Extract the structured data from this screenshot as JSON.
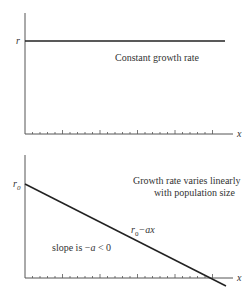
{
  "chart_data": [
    {
      "type": "line",
      "title": "Constant growth rate",
      "xlabel": "x",
      "ylabel": "r",
      "series": [
        {
          "name": "r",
          "x": [
            0,
            1
          ],
          "values": [
            1,
            1
          ]
        }
      ],
      "annotation": "Constant growth rate",
      "grid": false,
      "x_ticks": "unlabeled minor ticks with major ticks every 5"
    },
    {
      "type": "line",
      "title": "Growth rate varies linearly with population size",
      "xlabel": "x",
      "ylabel": "r0",
      "series": [
        {
          "name": "r0 - ax",
          "x": [
            0,
            1
          ],
          "values": [
            1,
            0
          ]
        }
      ],
      "annotations": [
        "Growth rate varies linearly",
        "with population size",
        "r0−ax",
        "slope is −a < 0"
      ],
      "grid": false
    }
  ],
  "top": {
    "ylabel": "r",
    "xlabel": "x",
    "annotation": "Constant growth rate"
  },
  "bottom": {
    "ylabel": "r",
    "ylabel_sub": "0",
    "xlabel": "x",
    "title_line1": "Growth rate varies linearly",
    "title_line2": "with population size",
    "line_label_r": "r",
    "line_label_sub": "0",
    "line_label_rest": "−ax",
    "slope_label_a": "slope is −",
    "slope_label_b": "a",
    "slope_label_c": " < 0"
  }
}
